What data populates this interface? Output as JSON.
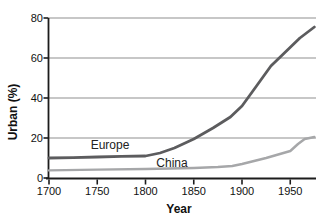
{
  "chart_data": {
    "type": "line",
    "title": "",
    "xlabel": "Year",
    "ylabel": "Urban (%)",
    "x_ticks": [
      "1700",
      "1750",
      "1800",
      "1850",
      "1900",
      "1950"
    ],
    "x_tick_values": [
      1700,
      1750,
      1800,
      1850,
      1900,
      1950
    ],
    "y_ticks": [
      "0",
      "20",
      "40",
      "60",
      "80"
    ],
    "y_tick_values": [
      0,
      20,
      40,
      60,
      80
    ],
    "xlim": [
      1700,
      1978
    ],
    "ylim": [
      0,
      80
    ],
    "grid": "horizontal-only",
    "legend": "inline-labels-on-plot",
    "colors": {
      "axis": "#1c1c1c",
      "gridline": "#8f8f8f",
      "text": "#111111"
    },
    "series": [
      {
        "name": "Europe",
        "color": "#5c5c5e",
        "points": [
          [
            1700,
            10
          ],
          [
            1725,
            10.2
          ],
          [
            1750,
            10.5
          ],
          [
            1775,
            10.8
          ],
          [
            1800,
            11
          ],
          [
            1815,
            12.5
          ],
          [
            1830,
            15
          ],
          [
            1850,
            19.5
          ],
          [
            1870,
            25
          ],
          [
            1888,
            30.5
          ],
          [
            1900,
            36
          ],
          [
            1915,
            46
          ],
          [
            1930,
            56
          ],
          [
            1945,
            63
          ],
          [
            1960,
            70
          ],
          [
            1975,
            75.5
          ]
        ]
      },
      {
        "name": "China",
        "color": "#a6a7a9",
        "points": [
          [
            1700,
            3.8
          ],
          [
            1750,
            4.2
          ],
          [
            1800,
            4.5
          ],
          [
            1850,
            5
          ],
          [
            1875,
            5.5
          ],
          [
            1890,
            6
          ],
          [
            1900,
            7
          ],
          [
            1925,
            10
          ],
          [
            1950,
            13.5
          ],
          [
            1958,
            17
          ],
          [
            1965,
            19.5
          ],
          [
            1975,
            20.5
          ]
        ]
      }
    ]
  }
}
